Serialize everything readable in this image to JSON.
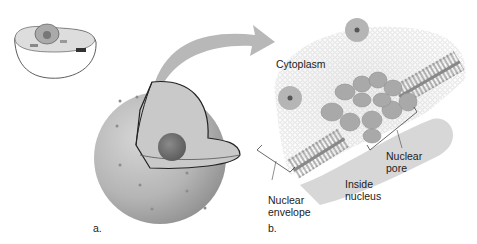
{
  "figure": {
    "panel_a": {
      "label": "a."
    },
    "panel_b": {
      "label": "b.",
      "labels": {
        "cytoplasm": "Cytoplasm",
        "nuclear_pore_1": "Nuclear",
        "nuclear_pore_2": "pore",
        "inside_nucleus_1": "Inside",
        "inside_nucleus_2": "nucleus",
        "nuclear_envelope_1": "Nuclear",
        "nuclear_envelope_2": "envelope"
      }
    }
  }
}
